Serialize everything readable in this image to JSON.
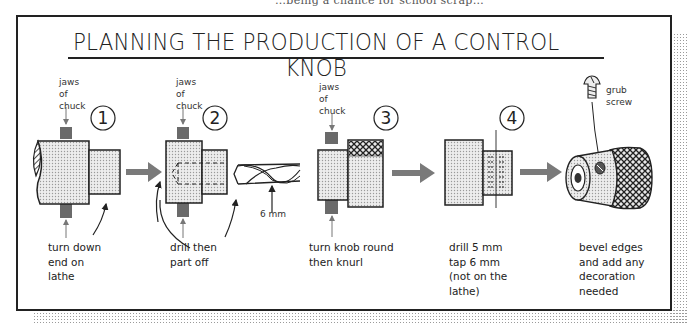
{
  "header": {
    "top_cut_text": "…being a chance for school scrap…",
    "title": "PLANNING THE PRODUCTION OF A CONTROL KNOB"
  },
  "steps": [
    {
      "number": "1",
      "chuck_label": [
        "jaws",
        "of",
        "chuck"
      ],
      "caption": [
        "turn down",
        "end on",
        "lathe"
      ]
    },
    {
      "number": "2",
      "chuck_label": [
        "jaws",
        "of",
        "chuck"
      ],
      "caption": [
        "drill then",
        "part off"
      ],
      "drill_size": "6 mm"
    },
    {
      "number": "3",
      "chuck_label": [
        "jaws",
        "of",
        "chuck"
      ],
      "caption": [
        "turn knob round",
        "then knurl"
      ]
    },
    {
      "number": "4",
      "caption": [
        "drill 5 mm",
        "tap 6 mm",
        "(not on the",
        "lathe)"
      ]
    },
    {
      "number": "",
      "part_label": [
        "grub",
        "screw"
      ],
      "caption": [
        "bevel edges",
        "and add any",
        "decoration",
        "needed"
      ]
    }
  ],
  "colors": {
    "line": "#222222",
    "jaw_fill": "#6a6a6a",
    "arrow_fill": "#7a7a7a",
    "stipple": "#c8c8c8"
  }
}
